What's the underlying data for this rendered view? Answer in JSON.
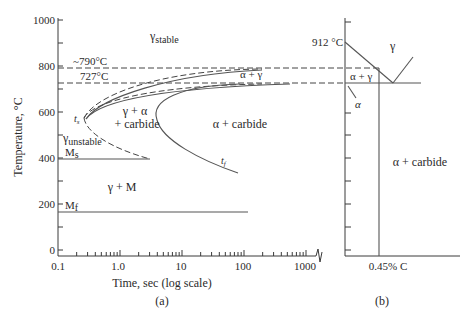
{
  "panel_a": {
    "ylabel": "Temperature, °C",
    "xlabel": "Time, sec (log scale)",
    "caption": "(a)",
    "yticks": [
      "1000",
      "800",
      "600",
      "400",
      "200",
      "0"
    ],
    "xticks": [
      "0.1",
      "1.0",
      "10",
      "100",
      "1000"
    ],
    "lines": {
      "upper_dashed": "~790°C",
      "lower_dashed": "727°C",
      "ms": "M",
      "ms_sub": "s",
      "mf": "M",
      "mf_sub": "f"
    },
    "regions": {
      "gamma_stable": "γ",
      "gamma_stable_sub": "stable",
      "gamma_unstable": "γ",
      "gamma_unstable_sub": "unstable",
      "alpha_gamma": "α + γ",
      "gamma_alpha_carbide_1": "γ + α",
      "gamma_alpha_carbide_2": "+ carbide",
      "alpha_carbide": "α + carbide",
      "gamma_m": "γ + M"
    },
    "curve_labels": {
      "ts": "t",
      "ts_sub": "s",
      "tf": "t",
      "tf_sub": "f"
    }
  },
  "panel_b": {
    "caption": "(b)",
    "temp_label": "912 °C",
    "composition_label": "0.45% C",
    "regions": {
      "gamma": "γ",
      "alpha_gamma": "α + γ",
      "alpha": "α",
      "alpha_carbide": "α + carbide"
    }
  }
}
